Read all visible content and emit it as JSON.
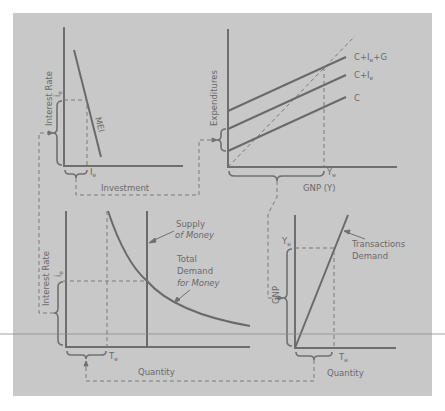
{
  "figure": {
    "background": "#c8c8c8",
    "line_color": "#6e6e6e"
  },
  "top_left": {
    "y_axis_label": "Interest Rate",
    "y_value_label": "i",
    "y_value_sub": "e",
    "x_axis_label": "Investment",
    "x_value_label": "I",
    "x_value_sub": "e",
    "curve_label": "MEI"
  },
  "top_right": {
    "y_axis_label": "Expenditures",
    "x_axis_label": "GNP (Y)",
    "x_value_label": "Y",
    "x_value_sub": "e",
    "lines": [
      {
        "label": "C+I",
        "sub": "e",
        "suffix": "+G"
      },
      {
        "label": "C+I",
        "sub": "e",
        "suffix": ""
      },
      {
        "label": "C",
        "sub": "",
        "suffix": ""
      }
    ]
  },
  "bottom_left": {
    "y_axis_label": "Interest Rate",
    "y_value_label": "i",
    "y_value_sub": "e",
    "x_axis_label": "Quantity",
    "x_value_label": "T",
    "x_value_sub": "e",
    "supply_label_1": "Supply",
    "supply_label_2": "of Money",
    "demand_label_1": "Total",
    "demand_label_2": "Demand",
    "demand_label_3": "for Money"
  },
  "bottom_right": {
    "y_axis_label": "GNP",
    "y_value_label": "Y",
    "y_value_sub": "e",
    "x_axis_label": "Quantity",
    "x_value_label": "T",
    "x_value_sub": "e",
    "curve_label_1": "Transactions",
    "curve_label_2": "Demand"
  }
}
